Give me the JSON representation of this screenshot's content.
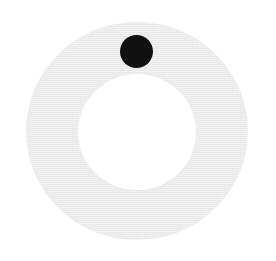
{
  "widget": {
    "type": "ring-dial",
    "ring_color": "#ececec",
    "hole_color": "#ffffff",
    "indicator_color": "#111111",
    "indicator_position": "top"
  }
}
